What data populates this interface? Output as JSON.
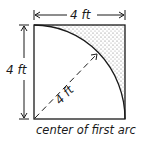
{
  "diagram": {
    "type": "geometry-sketch",
    "labels": {
      "top_dimension": "4 ft",
      "left_dimension": "4 ft",
      "radius": "4 ft",
      "caption": "center of first arc"
    },
    "colors": {
      "line": "#1a1a1a",
      "stipple": "#7a7a7a",
      "background": "#ffffff"
    }
  }
}
